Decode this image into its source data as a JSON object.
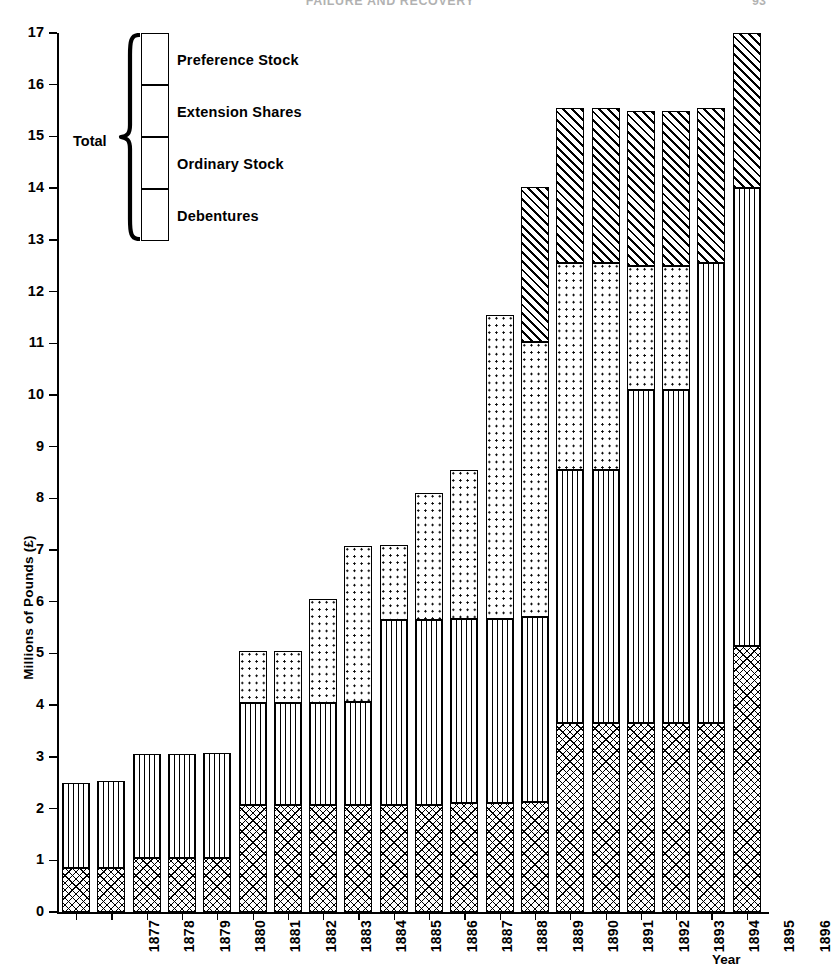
{
  "header": {
    "running_title": "FAILURE AND RECOVERY",
    "page_number": "93"
  },
  "axes": {
    "y_title": "Millions of Pounds (£)",
    "x_title": "Year",
    "y_ticks": [
      "0",
      "1",
      "2",
      "3",
      "4",
      "5",
      "6",
      "7",
      "8",
      "9",
      "10",
      "11",
      "12",
      "13",
      "14",
      "15",
      "16",
      "17"
    ]
  },
  "legend": {
    "total_label": "Total",
    "items": [
      {
        "key": "preference",
        "label": "Preference Stock"
      },
      {
        "key": "extension",
        "label": "Extension Shares"
      },
      {
        "key": "ordinary",
        "label": "Ordinary Stock"
      },
      {
        "key": "debentures",
        "label": "Debentures"
      }
    ]
  },
  "chart_data": {
    "type": "bar",
    "subtype": "stacked",
    "title": "",
    "xlabel": "Year",
    "ylabel": "Millions of Pounds (£)",
    "ylim": [
      0,
      17
    ],
    "yticks": [
      0,
      1,
      2,
      3,
      4,
      5,
      6,
      7,
      8,
      9,
      10,
      11,
      12,
      13,
      14,
      15,
      16,
      17
    ],
    "grid": false,
    "legend_position": "upper-left",
    "categories": [
      "1877",
      "1878",
      "1879",
      "1880",
      "1881",
      "1882",
      "1883",
      "1884",
      "1885",
      "1886",
      "1887",
      "1888",
      "1889",
      "1890",
      "1891",
      "1892",
      "1893",
      "1894",
      "1895",
      "1896"
    ],
    "series": [
      {
        "name": "Debentures",
        "values": [
          0.85,
          0.85,
          1.05,
          1.05,
          1.05,
          2.07,
          2.07,
          2.07,
          2.07,
          2.07,
          2.07,
          2.1,
          2.1,
          2.12,
          3.65,
          3.65,
          3.65,
          3.65,
          3.65,
          5.15
        ]
      },
      {
        "name": "Ordinary Stock",
        "values": [
          1.65,
          1.68,
          2.0,
          2.0,
          2.02,
          1.98,
          1.98,
          1.98,
          2.0,
          3.58,
          3.58,
          3.57,
          3.57,
          3.58,
          4.9,
          4.9,
          6.45,
          6.45,
          8.9,
          8.85
        ]
      },
      {
        "name": "Extension Shares",
        "values": [
          0.0,
          0.0,
          0.0,
          0.0,
          0.0,
          1.0,
          1.0,
          2.0,
          3.0,
          1.45,
          2.45,
          2.88,
          5.88,
          5.33,
          4.0,
          4.0,
          2.4,
          2.4,
          0.0,
          0.0
        ]
      },
      {
        "name": "Preference Stock",
        "values": [
          0.0,
          0.0,
          0.0,
          0.0,
          0.0,
          0.0,
          0.0,
          0.0,
          0.0,
          0.0,
          0.0,
          0.0,
          0.0,
          3.0,
          3.0,
          3.0,
          3.0,
          3.0,
          3.0,
          3.0
        ]
      }
    ],
    "totals": [
      2.5,
      2.53,
      3.05,
      3.05,
      3.07,
      5.05,
      5.05,
      6.05,
      7.07,
      7.1,
      8.1,
      8.55,
      11.55,
      14.03,
      15.55,
      15.55,
      15.5,
      15.5,
      15.55,
      17.0
    ]
  }
}
